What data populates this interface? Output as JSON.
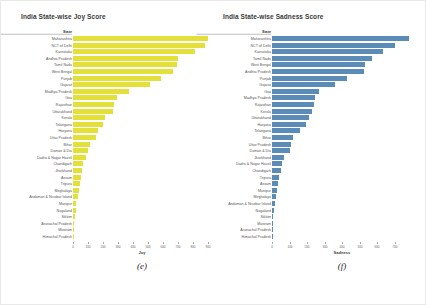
{
  "page": {
    "background": "#ffffff"
  },
  "chart_data": [
    {
      "type": "bar",
      "orientation": "horizontal",
      "title": "India State-wise Joy Score",
      "y_header": "State",
      "xlabel": "Joy",
      "caption": "(e)",
      "bar_color": "#e3e03a",
      "grid": false,
      "legend": "none",
      "xlim": [
        0,
        920
      ],
      "xticks": [
        0,
        100,
        200,
        300,
        400,
        500,
        600,
        700,
        800,
        900
      ],
      "categories": [
        "Maharashtra",
        "NCT of Delhi",
        "Karnataka",
        "Andhra Pradesh",
        "Tamil Nadu",
        "West Bengal",
        "Punjab",
        "Gujarat",
        "Madhya Pradesh",
        "Goa",
        "Rajasthan",
        "Uttarakhand",
        "Kerala",
        "Telangana",
        "Haryana",
        "Uttar Pradesh",
        "Bihar",
        "Daman & Diu",
        "Dadra & Nagar Haveli",
        "Chandigarh",
        "Jharkhand",
        "Assam",
        "Tripura",
        "Meghalaya",
        "Andaman & Nicobar Island",
        "Manipur",
        "Nagaland",
        "Sikkim",
        "Arunachal Pradesh",
        "Mizoram",
        "Himachal Pradesh"
      ],
      "values": [
        900,
        880,
        810,
        700,
        690,
        665,
        585,
        515,
        370,
        290,
        275,
        265,
        215,
        200,
        165,
        155,
        110,
        100,
        85,
        65,
        60,
        50,
        45,
        40,
        32,
        23,
        20,
        10,
        7,
        4,
        2
      ]
    },
    {
      "type": "bar",
      "orientation": "horizontal",
      "title": "India State-wise Sadness Score",
      "y_header": "State",
      "xlabel": "Sadness",
      "caption": "(f)",
      "bar_color": "#5b8cb8",
      "grid": false,
      "legend": "none",
      "xlim": [
        0,
        800
      ],
      "xticks": [
        0,
        100,
        200,
        300,
        400,
        500,
        600,
        700
      ],
      "categories": [
        "Maharashtra",
        "NCT of Delhi",
        "Karnataka",
        "Tamil Nadu",
        "West Bengal",
        "Andhra Pradesh",
        "Punjab",
        "Gujarat",
        "Goa",
        "Madhya Pradesh",
        "Rajasthan",
        "Kerala",
        "Uttarakhand",
        "Haryana",
        "Telangana",
        "Bihar",
        "Uttar Pradesh",
        "Daman & Diu",
        "Jharkhand",
        "Dadra & Nagar Haveli",
        "Chandigarh",
        "Tripura",
        "Assam",
        "Manipur",
        "Meghalaya",
        "Andaman & Nicobar Island",
        "Nagaland",
        "Sikkim",
        "Mizoram",
        "Arunachal Pradesh",
        "Himachal Pradesh"
      ],
      "values": [
        780,
        700,
        635,
        570,
        530,
        525,
        430,
        360,
        270,
        244,
        238,
        228,
        210,
        196,
        158,
        120,
        108,
        100,
        67,
        57,
        51,
        40,
        34,
        29,
        23,
        17,
        10,
        6,
        4,
        2,
        1
      ]
    }
  ]
}
